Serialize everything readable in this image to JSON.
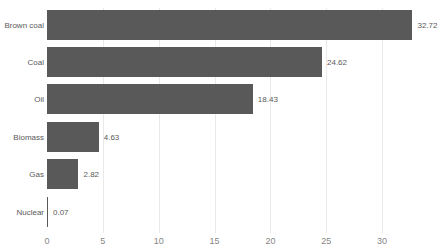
{
  "chart_data": {
    "type": "bar",
    "orientation": "horizontal",
    "title": "",
    "xlabel": "",
    "ylabel": "",
    "categories": [
      "Brown coal",
      "Coal",
      "Oil",
      "Biomass",
      "Gas",
      "Nuclear"
    ],
    "values": [
      32.72,
      24.62,
      18.43,
      4.63,
      2.82,
      0.07
    ],
    "value_labels": [
      "32.72",
      "24.62",
      "18.43",
      "4.63",
      "2.82",
      "0.07"
    ],
    "xticks": [
      "0",
      "5",
      "10",
      "15",
      "20",
      "25",
      "30"
    ],
    "xtick_values": [
      0,
      5,
      10,
      15,
      20,
      25,
      30
    ],
    "xlim": [
      0,
      35
    ],
    "grid": "vertical",
    "legend": "none",
    "colors": {
      "bar": "#595959",
      "label_text": "#595959",
      "tick_text": "#858585",
      "gridline": "#e9e9e9",
      "background": "#ffffff"
    }
  }
}
